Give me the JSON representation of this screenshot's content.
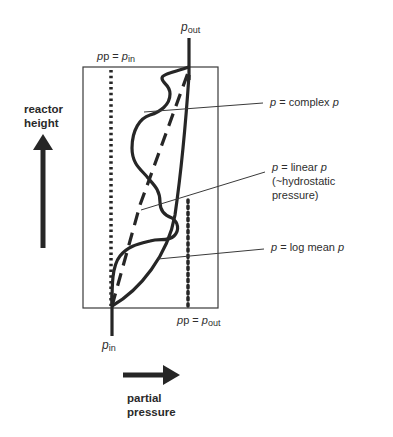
{
  "diagram": {
    "axes": {
      "y_label_line1": "reactor",
      "y_label_line2": "height",
      "x_label_line1": "partial",
      "x_label_line2": "pressure"
    },
    "top_labels": {
      "p_eq": "p = ",
      "p_in_sym": "p",
      "p_in_sub": "in",
      "p_out_sym": "p",
      "p_out_sub": "out"
    },
    "bottom_labels": {
      "p_eq": "p = ",
      "p_out_sym": "p",
      "p_out_sub": "out",
      "p_in_sym": "p",
      "p_in_sub": "in"
    },
    "curve_labels": [
      {
        "id": "complex",
        "prefix": "p",
        "text": " = complex ",
        "suffix": "p"
      },
      {
        "id": "linear",
        "prefix": "p",
        "text": " = linear ",
        "suffix": "p",
        "line2": "(~hydrostatic",
        "line3": "pressure)"
      },
      {
        "id": "logmean",
        "prefix": "p",
        "text": " = log mean ",
        "suffix": "p"
      }
    ],
    "colors": {
      "stroke": "#262626",
      "background": "#ffffff",
      "thin_line": "#3a3a3a"
    }
  }
}
